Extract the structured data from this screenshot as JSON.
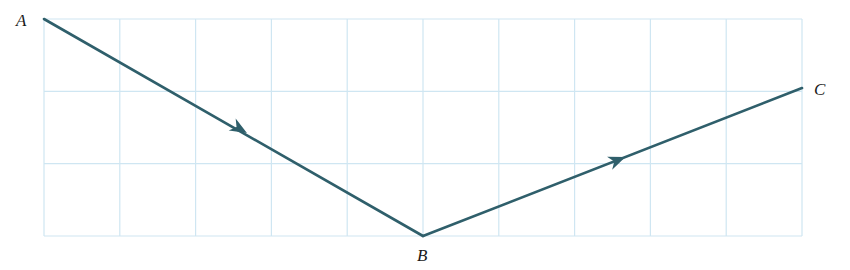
{
  "diagram": {
    "type": "vector path on grid",
    "grid": {
      "columns": 10,
      "rows": 3,
      "x0": 44,
      "y0": 19,
      "x1": 802,
      "y1": 236,
      "color": "#cfe6f2"
    },
    "line_color": "#2f5f6b",
    "points": [
      {
        "name": "A",
        "x": 44,
        "y": 19,
        "label_x": 16,
        "label_y": 11
      },
      {
        "name": "B",
        "x": 423,
        "y": 236,
        "label_x": 417,
        "label_y": 246
      },
      {
        "name": "C",
        "x": 802,
        "y": 88,
        "label_x": 814,
        "label_y": 80
      }
    ],
    "segments": [
      {
        "from": "A",
        "to": "B",
        "arrow_at": [
          240,
          129
        ]
      },
      {
        "from": "B",
        "to": "C",
        "arrow_at": [
          618,
          160
        ]
      }
    ]
  }
}
